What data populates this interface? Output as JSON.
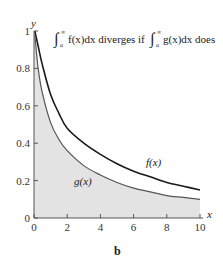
{
  "chart_data": {
    "type": "line",
    "panel_label": "b",
    "xlabel": "x",
    "ylabel": "y",
    "xlim": [
      0,
      10
    ],
    "ylim": [
      0,
      1
    ],
    "x_ticks": [
      "0",
      "2",
      "4",
      "6",
      "8",
      "10"
    ],
    "y_ticks": [
      "0",
      "0.2",
      "0.4",
      "0.6",
      "0.8",
      "1"
    ],
    "grid": false,
    "x": [
      0.05,
      0.25,
      0.5,
      1,
      1.5,
      2,
      3,
      4,
      5,
      6,
      7,
      8,
      9,
      10
    ],
    "series": [
      {
        "name": "f(x)",
        "values": [
          1.0,
          0.92,
          0.82,
          0.66,
          0.56,
          0.48,
          0.4,
          0.34,
          0.29,
          0.25,
          0.22,
          0.19,
          0.17,
          0.15
        ],
        "color": "#222222"
      },
      {
        "name": "g(x)",
        "values": [
          0.98,
          0.8,
          0.67,
          0.51,
          0.42,
          0.36,
          0.28,
          0.23,
          0.19,
          0.16,
          0.14,
          0.12,
          0.11,
          0.1
        ],
        "color": "#555555",
        "fill_below": "#e3e3e3"
      }
    ],
    "annotations": [
      "f(x)",
      "g(x)"
    ]
  },
  "labels": {
    "title_part1": "f(x)dx diverges if",
    "title_part2": "g(x)dx does",
    "f_label": "f(x)",
    "g_label": "g(x)",
    "panel": "b",
    "xaxis": "x",
    "yaxis": "y"
  }
}
